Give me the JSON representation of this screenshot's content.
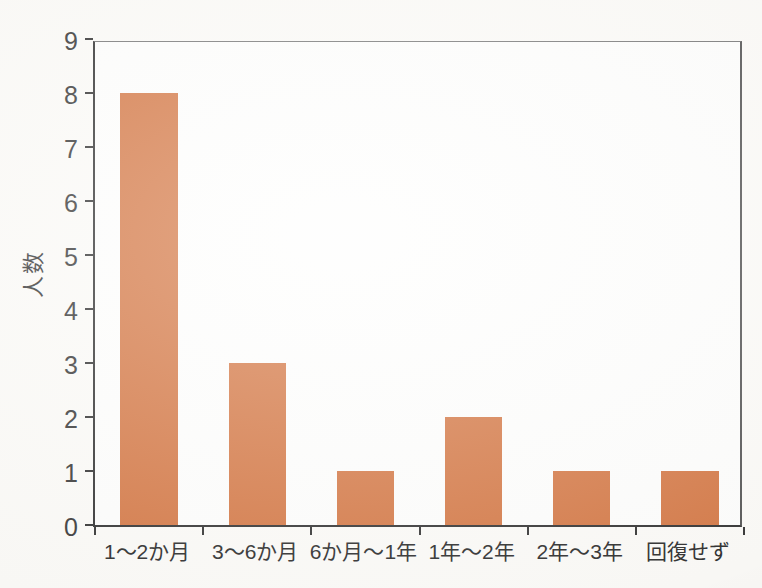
{
  "chart_data": {
    "type": "bar",
    "title": "",
    "xlabel": "",
    "ylabel": "人数",
    "categories": [
      "1〜2か月",
      "3〜6か月",
      "6か月〜1年",
      "1年〜2年",
      "2年〜3年",
      "回復せず"
    ],
    "values": [
      8,
      3,
      1,
      2,
      1,
      1
    ],
    "ylim": [
      0,
      9
    ],
    "ytick_step": 1,
    "yticks": [
      0,
      1,
      2,
      3,
      4,
      5,
      6,
      7,
      8,
      9
    ],
    "grid": false,
    "legend": null,
    "tick_layout": "ticks-at-category-boundaries",
    "colors": {
      "bar": "#d67d4c",
      "axis": "#3a3a3a",
      "box": "#7d7d7d",
      "text": "#3f3f3f",
      "plot_background": "#fefefd",
      "paper_background": "#fcfbf8"
    }
  }
}
